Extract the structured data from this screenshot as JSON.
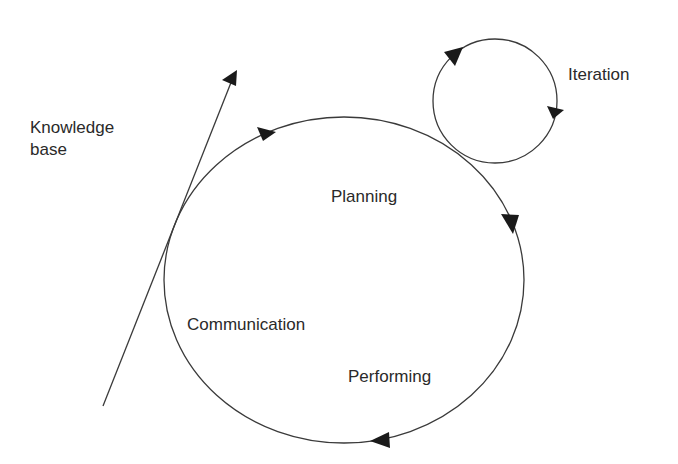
{
  "diagram": {
    "labels": {
      "knowledge_line1": "Knowledge",
      "knowledge_line2": "base",
      "iteration": "Iteration",
      "planning": "Planning",
      "communication": "Communication",
      "performing": "Performing"
    },
    "colors": {
      "line": "#3a3a3a",
      "arrowhead": "#1a1a1a",
      "text": "#2a2a2a",
      "background": "#ffffff"
    }
  }
}
